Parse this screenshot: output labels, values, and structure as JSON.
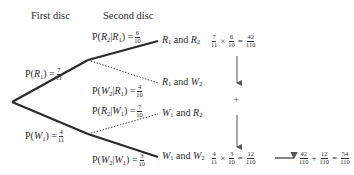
{
  "headers": {
    "first": "First disc",
    "second": "Second disc"
  },
  "first_stage": {
    "upper": {
      "label": "P(",
      "event": "R",
      "sub": "1",
      "close": ") =",
      "num": "7",
      "den": "11"
    },
    "lower": {
      "label": "P(",
      "event": "W",
      "sub": "1",
      "close": ") =",
      "num": "4",
      "den": "11"
    }
  },
  "second_stage": [
    {
      "pre": "P(",
      "e1": "R",
      "s1": "2",
      "bar": "|",
      "e2": "R",
      "s2": "1",
      "close": ") =",
      "num": "6",
      "den": "10",
      "style": "solid"
    },
    {
      "pre": "P(",
      "e1": "W",
      "s1": "2",
      "bar": "|",
      "e2": "R",
      "s2": "1",
      "close": ") =",
      "num": "4",
      "den": "10",
      "style": "dotted"
    },
    {
      "pre": "P(",
      "e1": "R",
      "s1": "2",
      "bar": "|",
      "e2": "W",
      "s2": "1",
      "close": ") =",
      "num": "7",
      "den": "10",
      "style": "dotted"
    },
    {
      "pre": "P(",
      "e1": "W",
      "s1": "2",
      "bar": "|",
      "e2": "W",
      "s2": "1",
      "close": ") =",
      "num": "3",
      "den": "10",
      "style": "solid"
    }
  ],
  "outcomes": [
    {
      "a": "R",
      "as": "1",
      "and": "and",
      "b": "R",
      "bs": "2"
    },
    {
      "a": "R",
      "as": "1",
      "and": "and",
      "b": "W",
      "bs": "2"
    },
    {
      "a": "W",
      "as": "1",
      "and": "and",
      "b": "R",
      "bs": "2"
    },
    {
      "a": "W",
      "as": "1",
      "and": "and",
      "b": "W",
      "bs": "2"
    }
  ],
  "calculations": {
    "top": {
      "n1": "7",
      "d1": "11",
      "times": "×",
      "n2": "6",
      "d2": "10",
      "eq": "=",
      "rn": "42",
      "rd": "110"
    },
    "plus": "+",
    "bottom": {
      "n1": "4",
      "d1": "11",
      "times": "×",
      "n2": "3",
      "d2": "10",
      "eq": "=",
      "rn": "12",
      "rd": "110"
    },
    "total": {
      "n1": "42",
      "d1": "110",
      "plus": "+",
      "n2": "12",
      "d2": "110",
      "eq": "=",
      "rn": "54",
      "rd": "110"
    }
  },
  "colors": {
    "line": "#2a2a2a",
    "text": "#2a2a2a",
    "arrow": "#555555"
  }
}
